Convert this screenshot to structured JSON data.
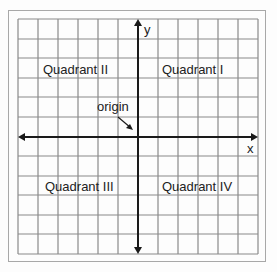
{
  "diagram": {
    "axes": {
      "x_label": "x",
      "y_label": "y"
    },
    "quadrants": [
      {
        "id": "I",
        "label": "Quadrant I"
      },
      {
        "id": "II",
        "label": "Quadrant II"
      },
      {
        "id": "III",
        "label": "Quadrant III"
      },
      {
        "id": "IV",
        "label": "Quadrant IV"
      }
    ],
    "origin_label": "origin",
    "grid": {
      "columns": 12,
      "rows": 12
    },
    "colors": {
      "grid": "#8a8a8a",
      "axis": "#1a1a1a",
      "frame": "#a8a8a8",
      "text": "#222222"
    }
  }
}
